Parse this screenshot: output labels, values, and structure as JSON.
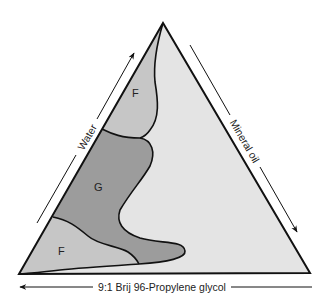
{
  "diagram": {
    "type": "ternary-phase-diagram",
    "colors": {
      "background": "#ffffff",
      "triangle_fill": "#e4e4e4",
      "region_F_fill": "#c6c6c6",
      "region_G_fill": "#9c9c9c",
      "stroke": "#111111"
    },
    "vertices": {
      "top": "Water / Mineral oil apex",
      "bottom_left": "9:1 Brij 96-Propylene glycol corner",
      "bottom_right": "Mineral oil corner"
    },
    "axes": {
      "left": {
        "label": "Water",
        "arrow_direction": "up"
      },
      "right": {
        "label": "Mineral oil",
        "arrow_direction": "down"
      },
      "bottom": {
        "label": "9:1 Brij 96-Propylene glycol",
        "arrow_direction": "left"
      }
    },
    "regions": [
      {
        "id": "F-upper",
        "label": "F",
        "description": "upper fluid region near water-rich side"
      },
      {
        "id": "G",
        "label": "G",
        "description": "gel region"
      },
      {
        "id": "F-lower",
        "label": "F",
        "description": "lower fluid region near surfactant-rich corner"
      }
    ]
  }
}
